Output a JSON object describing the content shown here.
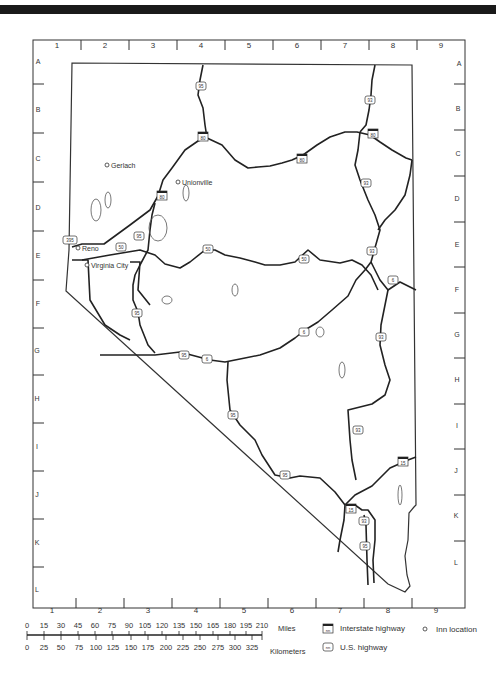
{
  "map": {
    "title": "Nevada highway map",
    "grid_columns": [
      "1",
      "2",
      "3",
      "4",
      "5",
      "6",
      "7",
      "8",
      "9"
    ],
    "grid_rows": [
      "A",
      "B",
      "C",
      "D",
      "E",
      "F",
      "G",
      "H",
      "I",
      "J",
      "K",
      "L"
    ],
    "inn_locations": [
      {
        "name": "Gerlach",
        "label": "Gerlach"
      },
      {
        "name": "Unionville",
        "label": "Unionville"
      },
      {
        "name": "Reno",
        "label": "Reno"
      },
      {
        "name": "Virginia City",
        "label": "Virginia City"
      }
    ],
    "interstate_shields": [
      "80",
      "80",
      "80",
      "80",
      "80",
      "15",
      "15"
    ],
    "us_highway_shields": [
      "95",
      "93",
      "93",
      "93",
      "93",
      "395",
      "50",
      "50",
      "50",
      "95",
      "95",
      "95",
      "6",
      "6",
      "6",
      "95",
      "93",
      "95",
      "93"
    ]
  },
  "scale": {
    "miles_label": "Miles",
    "miles_ticks": [
      "0",
      "15",
      "30",
      "45",
      "60",
      "75",
      "90",
      "105",
      "120",
      "135",
      "150",
      "165",
      "180",
      "195",
      "210"
    ],
    "km_label": "Kilometers",
    "km_ticks": [
      "0",
      "25",
      "50",
      "75",
      "100",
      "125",
      "150",
      "175",
      "200",
      "225",
      "250",
      "275",
      "300",
      "325"
    ]
  },
  "legend": {
    "interstate_label": "Interstate highway",
    "us_highway_label": "U.S. highway",
    "inn_label": "Inn location",
    "shield_placeholder": "nn"
  }
}
